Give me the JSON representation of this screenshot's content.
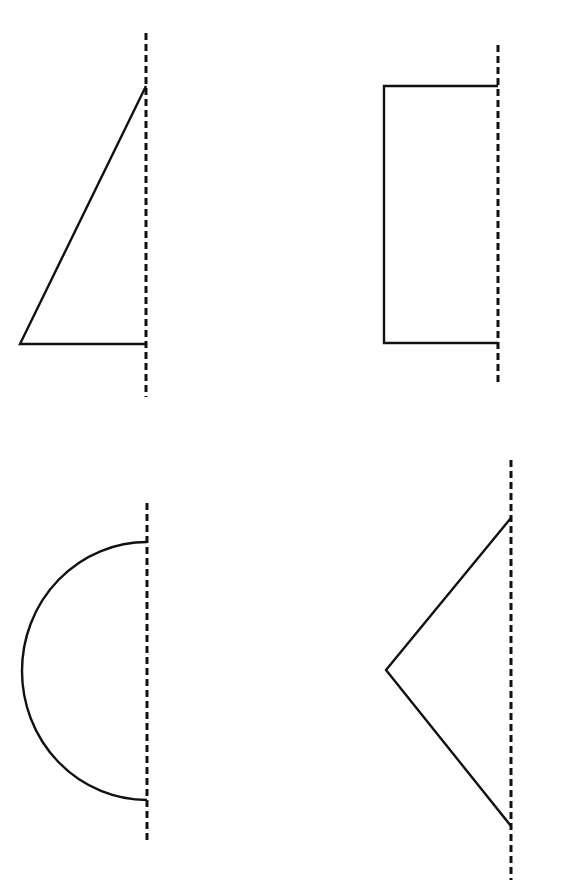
{
  "diagram": {
    "title": "",
    "colors": {
      "background": "#ffffff",
      "stroke": "#111111"
    },
    "figures": [
      {
        "id": "half-triangle",
        "shape": "right triangle (half of isosceles triangle)",
        "axis": {
          "x": 146,
          "y1": 33,
          "y2": 397
        },
        "points": [
          [
            146,
            86
          ],
          [
            20,
            344
          ],
          [
            146,
            344
          ]
        ]
      },
      {
        "id": "half-rectangle",
        "shape": "half rectangle (open on axis side)",
        "axis": {
          "x": 498,
          "y1": 45,
          "y2": 385
        },
        "points": [
          [
            498,
            86
          ],
          [
            384,
            86
          ],
          [
            384,
            343
          ],
          [
            498,
            343
          ]
        ]
      },
      {
        "id": "half-circle",
        "shape": "semicircle",
        "axis": {
          "x": 147,
          "y1": 503,
          "y2": 843
        },
        "arc": {
          "start": [
            147,
            542
          ],
          "end": [
            147,
            800
          ],
          "leftmost_x": 22
        }
      },
      {
        "id": "half-rhombus",
        "shape": "open V (half of a kite/rhombus)",
        "axis": {
          "x": 511,
          "y1": 460,
          "y2": 880
        },
        "points": [
          [
            511,
            518
          ],
          [
            386,
            670
          ],
          [
            511,
            826
          ]
        ]
      }
    ]
  }
}
